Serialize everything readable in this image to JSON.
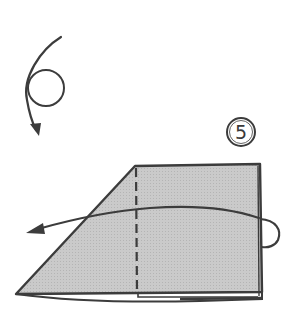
{
  "diagram": {
    "type": "origami-folding-step",
    "step_number": "5",
    "colors": {
      "line": "#3c3c3c",
      "paper_fill": "#c4c4c4",
      "background": "#ffffff"
    },
    "elements": [
      {
        "name": "turn-over-symbol",
        "description": "curved arrow looping around a circle, indicating turn the model over"
      },
      {
        "name": "step-number",
        "value": "5",
        "style": "circled"
      },
      {
        "name": "folded-paper",
        "description": "trapezoid shaded paper with vertical dashed valley-fold line"
      },
      {
        "name": "fold-arrow",
        "description": "curved arrow from right edge wrapping behind, pointing left"
      }
    ]
  }
}
